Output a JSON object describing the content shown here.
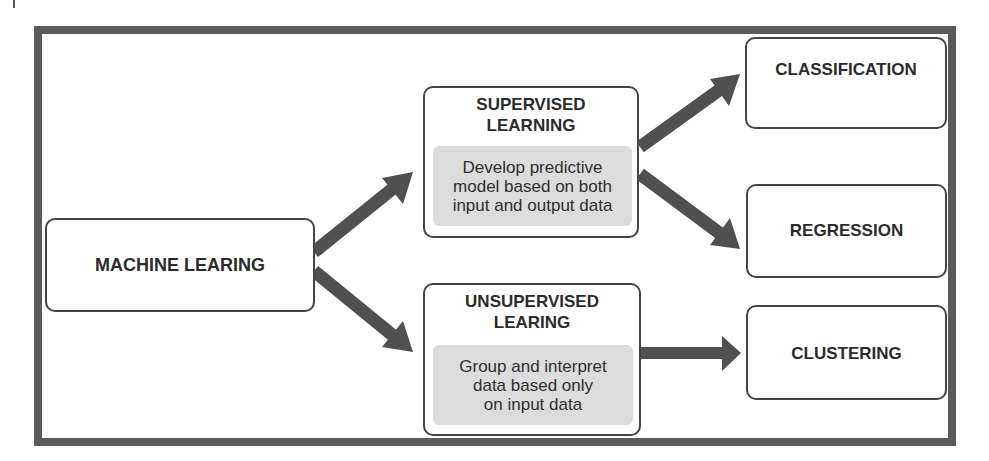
{
  "diagram": {
    "root": {
      "label": "MACHINE LEARING"
    },
    "supervised": {
      "title_line1": "SUPERVISED",
      "title_line2": "LEARNING",
      "desc_line1": "Develop predictive",
      "desc_line2": "model based on both",
      "desc_line3": "input and output data"
    },
    "unsupervised": {
      "title_line1": "UNSUPERVISED",
      "title_line2": "LEARING",
      "desc_line1": "Group and interpret",
      "desc_line2": "data based only",
      "desc_line3": "on input data"
    },
    "leaves": {
      "classification": "CLASSIFICATION",
      "regression": "REGRESSION",
      "clustering": "CLUSTERING"
    },
    "colors": {
      "frame": "#5a5a5a",
      "arrow": "#505050",
      "box_border": "#444444",
      "desc_fill": "#dcdcdc"
    }
  }
}
